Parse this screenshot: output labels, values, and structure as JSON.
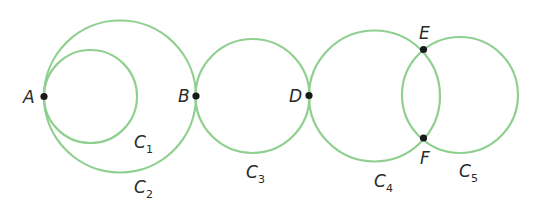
{
  "diagram": {
    "stroke_color": "#8fcf8f",
    "point_color": "#1a1a1a",
    "circles": [
      {
        "name": "C",
        "sub": "1",
        "cx": 90.5,
        "cy": 96.5,
        "r": 46.5,
        "label_x": 134,
        "label_y": 148,
        "sub_x": 146,
        "sub_y": 153
      },
      {
        "name": "C",
        "sub": "2",
        "cx": 120,
        "cy": 96.5,
        "r": 76,
        "label_x": 134,
        "label_y": 193,
        "sub_x": 146,
        "sub_y": 198
      },
      {
        "name": "C",
        "sub": "3",
        "cx": 252.5,
        "cy": 96,
        "r": 57,
        "label_x": 246,
        "label_y": 178,
        "sub_x": 258,
        "sub_y": 183
      },
      {
        "name": "C",
        "sub": "4",
        "cx": 374.5,
        "cy": 96,
        "r": 65.5,
        "label_x": 374,
        "label_y": 187,
        "sub_x": 386,
        "sub_y": 192
      },
      {
        "name": "C",
        "sub": "5",
        "cx": 460,
        "cy": 95,
        "r": 58,
        "label_x": 459,
        "label_y": 177,
        "sub_x": 471,
        "sub_y": 182
      }
    ],
    "points": [
      {
        "label": "A",
        "x": 44,
        "y": 96.5,
        "label_x": 23,
        "label_y": 103
      },
      {
        "label": "B",
        "x": 196,
        "y": 96,
        "label_x": 178,
        "label_y": 102
      },
      {
        "label": "D",
        "x": 309,
        "y": 95.5,
        "label_x": 289,
        "label_y": 102
      },
      {
        "label": "E",
        "x": 423.5,
        "y": 49.5,
        "label_x": 419,
        "label_y": 39
      },
      {
        "label": "F",
        "x": 423.5,
        "y": 138,
        "label_x": 420,
        "label_y": 164
      }
    ]
  }
}
